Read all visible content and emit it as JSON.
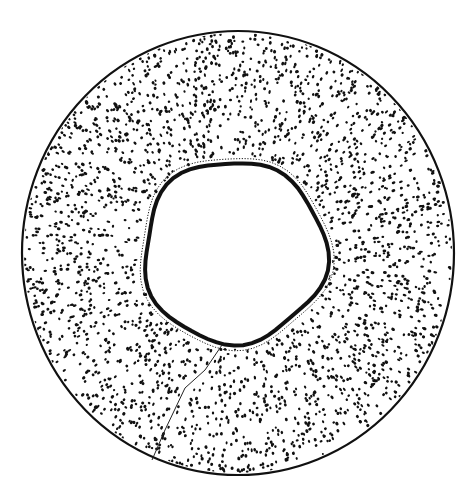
{
  "figure": {
    "colors": {
      "ink": "#111111",
      "paper": "#ffffff"
    },
    "outer": {
      "cx": 238,
      "cy": 253,
      "rx": 216,
      "ry": 222
    },
    "inner": {
      "cx": 234,
      "cy": 252,
      "r": 91
    },
    "crack": {
      "points": [
        [
          222,
          345
        ],
        [
          205,
          370
        ],
        [
          185,
          388
        ],
        [
          165,
          430
        ],
        [
          152,
          460
        ]
      ]
    },
    "radial_band": {
      "angle_deg": -40
    },
    "stipple": {
      "count": 2600,
      "seed": 7
    }
  }
}
